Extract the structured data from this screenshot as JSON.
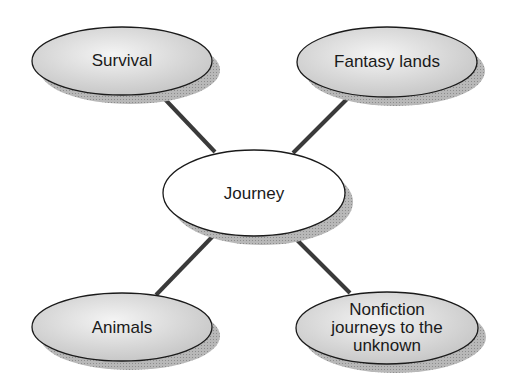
{
  "diagram": {
    "type": "concept-web",
    "center": {
      "label": "Journey",
      "cx": 254,
      "cy": 193,
      "rx": 91,
      "ry": 43,
      "fill": "#ffffff"
    },
    "nodes": [
      {
        "id": "survival",
        "label": "Survival",
        "cx": 122,
        "cy": 61,
        "rx": 90,
        "ry": 34,
        "line_from": [
          160,
          94
        ],
        "line_to": [
          215,
          152
        ]
      },
      {
        "id": "fantasy-lands",
        "label": "Fantasy lands",
        "cx": 387,
        "cy": 62,
        "rx": 90,
        "ry": 35,
        "line_from": [
          350,
          96
        ],
        "line_to": [
          293,
          153
        ]
      },
      {
        "id": "animals",
        "label": "Animals",
        "cx": 122,
        "cy": 327,
        "rx": 90,
        "ry": 34,
        "line_from": [
          156,
          295
        ],
        "line_to": [
          214,
          235
        ]
      },
      {
        "id": "nonfiction",
        "label": "Nonfiction journeys to the unknown",
        "label_lines": [
          "Nonfiction",
          "journeys to the",
          "unknown"
        ],
        "cx": 387,
        "cy": 328,
        "rx": 91,
        "ry": 36,
        "line_from": [
          350,
          293
        ],
        "line_to": [
          293,
          236
        ]
      }
    ],
    "colors": {
      "node_fill": "#d6d6d6",
      "node_highlight": "#f2f2f2",
      "outline": "#1a1a1a",
      "shadow": "#a8a8a8",
      "connector": "#3a3a3a"
    }
  }
}
